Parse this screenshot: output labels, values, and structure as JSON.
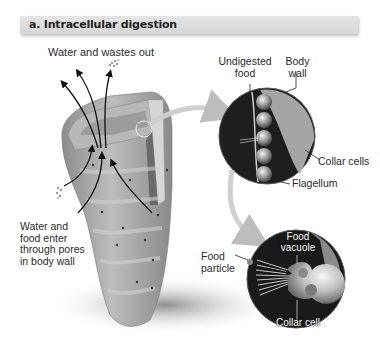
{
  "header": {
    "title": "a. Intracellular digestion"
  },
  "labels": {
    "water_wastes_out": "Water and wastes out",
    "water_food_enter": [
      "Water and",
      "food enter",
      "through pores",
      "in body wall"
    ],
    "undigested_food": [
      "Undigested",
      "food"
    ],
    "body_wall": [
      "Body",
      "wall"
    ],
    "collar_cells": "Collar cells",
    "flagellum": "Flagellum",
    "food_particle": [
      "Food",
      "particle"
    ],
    "food_vacuole": [
      "Food",
      "vacuole"
    ],
    "collar_cell": "Collar cell"
  },
  "colors": {
    "title_bar": "#dcdcdc",
    "sponge_body": "#a9a9a9",
    "circle_bg": "#1c1c1c",
    "arrow": "#111111",
    "connector": "#cfcfcf"
  }
}
